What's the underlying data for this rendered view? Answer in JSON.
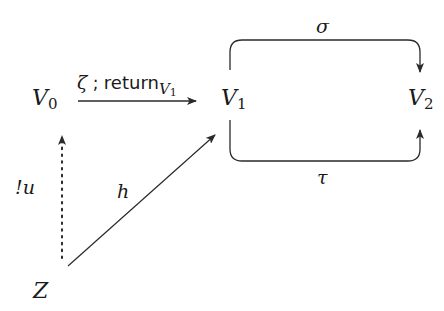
{
  "diagram": {
    "type": "commutative-diagram",
    "nodes": [
      {
        "id": "V0",
        "base": "V",
        "sub": "0"
      },
      {
        "id": "V1",
        "base": "V",
        "sub": "1"
      },
      {
        "id": "V2",
        "base": "V",
        "sub": "2"
      },
      {
        "id": "Z",
        "base": "Z",
        "sub": ""
      }
    ],
    "edges": [
      {
        "id": "zeta-return",
        "from": "V0",
        "to": "V1",
        "style": "solid",
        "label_greek": "ζ",
        "label_sep": " ; ",
        "label_word": "return",
        "label_sub_base": "V",
        "label_sub_index": "1"
      },
      {
        "id": "sigma",
        "from": "V1",
        "to": "V2",
        "style": "solid-curved-over",
        "label": "σ"
      },
      {
        "id": "tau",
        "from": "V1",
        "to": "V2",
        "style": "solid-curved-under",
        "label": "τ"
      },
      {
        "id": "bang-u",
        "from": "Z",
        "to": "V0",
        "style": "dotted",
        "label": "!u"
      },
      {
        "id": "h",
        "from": "Z",
        "to": "V1",
        "style": "solid",
        "label": "h"
      }
    ],
    "colors": {
      "stroke": "#2a2a2a",
      "text": "#1a1a1a",
      "background": "#ffffff"
    }
  }
}
